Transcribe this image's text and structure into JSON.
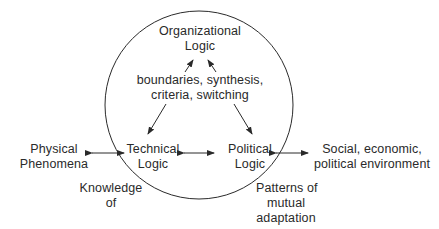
{
  "diagram": {
    "nodes": {
      "organizational": {
        "line1": "Organizational",
        "line2": "Logic"
      },
      "technical": {
        "line1": "Technical",
        "line2": "Logic"
      },
      "political": {
        "line1": "Political",
        "line2": "Logic"
      },
      "physical": {
        "line1": "Physical",
        "line2": "Phenomena"
      },
      "social": {
        "line1": "Social, economic,",
        "line2": "political environment"
      }
    },
    "annotations": {
      "mechanisms": {
        "line1": "boundaries, synthesis,",
        "line2": "criteria, switching"
      },
      "knowledge": {
        "line1": "Knowledge",
        "line2": "of"
      },
      "patterns": {
        "line1": "Patterns of",
        "line2": "mutual",
        "line3": "adaptation"
      }
    },
    "colors": {
      "stroke": "#2a2a2a",
      "background": "#ffffff"
    }
  }
}
